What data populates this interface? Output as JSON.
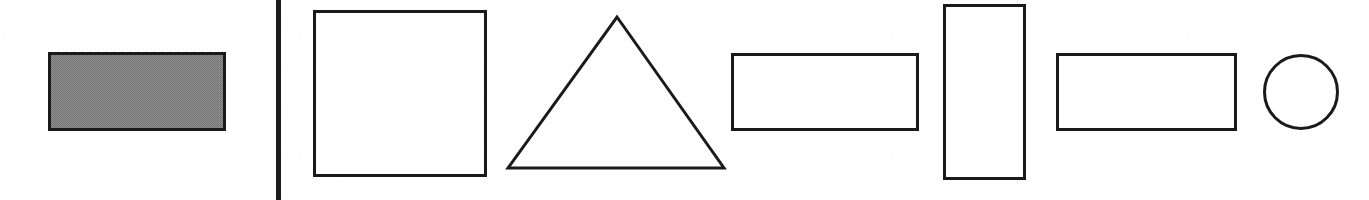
{
  "figure": {
    "canvas": {
      "width": 1369,
      "height": 200
    },
    "background_color": "#ffffff",
    "stroke_color": "#1a1a1a",
    "shaded_fill_color": "#8a8a8a",
    "media": "scanned line drawing"
  },
  "divider": {
    "name": "vertical-rule",
    "orientation": "vertical",
    "x": 276,
    "y": 0,
    "width": 5,
    "height": 200,
    "color": "#1c1c1c"
  },
  "shapes": [
    {
      "id": "shape-1",
      "kind": "rectangle",
      "label": "shaded rectangle",
      "fill": "shaded",
      "fill_color": "#8a8a8a",
      "x": 48,
      "y": 52,
      "width": 178,
      "height": 79,
      "stroke_width": 3
    },
    {
      "id": "shape-2",
      "kind": "square",
      "label": "square",
      "fill": "none",
      "fill_color": "#ffffff",
      "x": 313,
      "y": 10,
      "width": 174,
      "height": 167,
      "stroke_width": 3
    },
    {
      "id": "shape-3",
      "kind": "triangle",
      "label": "triangle",
      "fill": "none",
      "fill_color": "#ffffff",
      "apex_x": 617,
      "apex_y": 17,
      "base_left_x": 508,
      "base_right_x": 724,
      "base_y": 168,
      "points": "617,17 724,168 508,168",
      "stroke_width": 3
    },
    {
      "id": "shape-4",
      "kind": "rectangle",
      "label": "wide rectangle",
      "fill": "none",
      "fill_color": "#ffffff",
      "x": 731,
      "y": 53,
      "width": 188,
      "height": 78,
      "stroke_width": 3
    },
    {
      "id": "shape-5",
      "kind": "rectangle",
      "label": "tall rectangle",
      "fill": "none",
      "fill_color": "#ffffff",
      "x": 943,
      "y": 4,
      "width": 83,
      "height": 176,
      "stroke_width": 3
    },
    {
      "id": "shape-6",
      "kind": "rectangle",
      "label": "wide rectangle",
      "fill": "none",
      "fill_color": "#ffffff",
      "x": 1056,
      "y": 53,
      "width": 181,
      "height": 78,
      "stroke_width": 3
    },
    {
      "id": "shape-7",
      "kind": "circle",
      "label": "circle",
      "fill": "none",
      "fill_color": "#ffffff",
      "center_x": 1301,
      "center_y": 92,
      "radius": 38,
      "stroke_width": 3
    }
  ]
}
